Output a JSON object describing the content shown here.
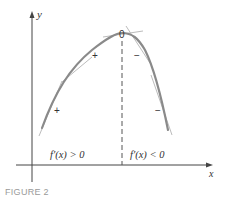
{
  "figure": {
    "caption": "FIGURE 2",
    "axes": {
      "x_label": "x",
      "y_label": "y"
    },
    "peak_label": "0",
    "signs": {
      "left_upper": "+",
      "left_lower": "+",
      "right_upper": "−",
      "right_lower": "−"
    },
    "regions": {
      "left": "f′(x) > 0",
      "right": "f′(x) < 0"
    },
    "colors": {
      "curve": "#8a8a8a",
      "tangent": "#bbbbbb",
      "axis": "#444444",
      "text": "#333333",
      "caption": "#9a9a9a"
    }
  }
}
